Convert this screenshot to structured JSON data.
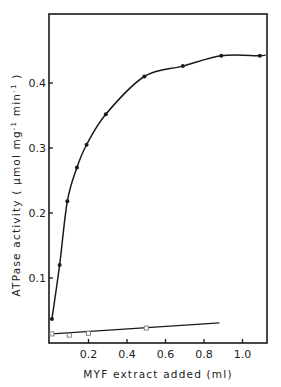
{
  "chart_data": {
    "type": "line",
    "title": "",
    "xlabel": "MYF extract added (ml)",
    "ylabel": "ATPase activity (μmol mg⁻¹ min⁻¹)",
    "ylabel_parts": [
      "ATPase",
      "activity",
      "(",
      "μmol",
      "mg",
      "-1",
      "min",
      "-1",
      ")"
    ],
    "xlim": [
      0,
      1.13
    ],
    "ylim": [
      0,
      0.5
    ],
    "xticks": [
      0.2,
      0.4,
      0.6,
      0.8,
      1.0
    ],
    "xtick_labels": [
      "0.2",
      "0.4",
      "0.6",
      "0.8",
      "1.0"
    ],
    "yticks": [
      0.1,
      0.2,
      0.3,
      0.4
    ],
    "ytick_labels": [
      "0.1",
      "0.2",
      "0.3",
      "0.4"
    ],
    "grid": false,
    "legend": null,
    "series": [
      {
        "name": "with MYF extract (filled circles)",
        "marker": "filled-circle",
        "x": [
          0.01,
          0.05,
          0.09,
          0.14,
          0.19,
          0.29,
          0.49,
          0.69,
          0.89,
          1.09
        ],
        "y": [
          0.037,
          0.12,
          0.218,
          0.27,
          0.305,
          0.352,
          0.41,
          0.426,
          0.442,
          0.442
        ],
        "curve_end": [
          1.12,
          0.443
        ]
      },
      {
        "name": "control (open squares)",
        "marker": "open-square",
        "x": [
          0.01,
          0.1,
          0.2,
          0.5
        ],
        "y": [
          0.014,
          0.012,
          0.015,
          0.023
        ],
        "line_end": [
          0.88,
          0.031
        ]
      }
    ],
    "colors": {
      "ink": "#1a1a1a",
      "background": "#ffffff"
    }
  }
}
